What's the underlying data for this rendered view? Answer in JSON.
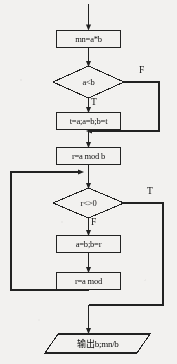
{
  "diagram": {
    "type": "flowchart",
    "title": "",
    "orientation": "top-to-bottom",
    "colors": {
      "background": "#f2f1ef",
      "stroke": "#222222",
      "text": "#111111",
      "node_fill": "#f2f1ef"
    },
    "nodes": [
      {
        "id": "entry-arrow",
        "shape": "arrow",
        "label": "",
        "name": "entry-arrow"
      },
      {
        "id": "init",
        "shape": "process",
        "label": "mn=a*b",
        "name": "process-mn-equals-a-times-b"
      },
      {
        "id": "compare",
        "shape": "decision",
        "label": "a<b",
        "name": "decision-a-less-than-b"
      },
      {
        "id": "swap",
        "shape": "process",
        "label": "t=a;a=b;b=t",
        "name": "process-swap-a-and-b"
      },
      {
        "id": "mod1",
        "shape": "process",
        "label": "r=a mod b",
        "name": "process-r-equals-a-mod-b"
      },
      {
        "id": "loop-test",
        "shape": "decision",
        "label": "r<>0",
        "name": "decision-r-not-equal-zero"
      },
      {
        "id": "shift",
        "shape": "process",
        "label": "a=b;b=r",
        "name": "process-a-equals-b-b-equals-r"
      },
      {
        "id": "mod2",
        "shape": "process",
        "label": "r=a mod",
        "name": "process-r-equals-a-mod"
      },
      {
        "id": "output",
        "shape": "input-output",
        "label": "输出b;mn/b",
        "name": "io-output-b-mn-over-b"
      }
    ],
    "branch_labels": {
      "compare_false": "F",
      "compare_true": "T",
      "loop_true": "T",
      "loop_false": "F"
    },
    "edges": [
      {
        "from": "entry-arrow",
        "to": "init",
        "label": ""
      },
      {
        "from": "init",
        "to": "compare",
        "label": ""
      },
      {
        "from": "compare",
        "to": "swap",
        "label": "T"
      },
      {
        "from": "compare",
        "to": "mod1",
        "label": "F"
      },
      {
        "from": "swap",
        "to": "mod1",
        "label": ""
      },
      {
        "from": "mod1",
        "to": "loop-test",
        "label": ""
      },
      {
        "from": "loop-test",
        "to": "shift",
        "label": "F"
      },
      {
        "from": "loop-test",
        "to": "output",
        "label": "T"
      },
      {
        "from": "shift",
        "to": "mod2",
        "label": ""
      },
      {
        "from": "mod2",
        "to": "loop-test",
        "label": ""
      }
    ]
  }
}
